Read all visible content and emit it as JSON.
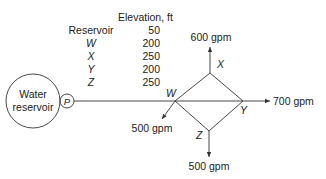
{
  "table": {
    "header": "Elevation, ft",
    "label_header": "Reservoir",
    "rows": [
      {
        "node": "Reservoir",
        "elevation": "50"
      },
      {
        "node": "W",
        "elevation": "200"
      },
      {
        "node": "X",
        "elevation": "250"
      },
      {
        "node": "Y",
        "elevation": "200"
      },
      {
        "node": "Z",
        "elevation": "250"
      }
    ]
  },
  "reservoir": {
    "label_line1": "Water",
    "label_line2": "reservoir"
  },
  "pump": {
    "label": "P"
  },
  "nodes": {
    "W": "W",
    "X": "X",
    "Y": "Y",
    "Z": "Z"
  },
  "flows": {
    "X": "600 gpm",
    "Y": "700 gpm",
    "W": "500 gpm",
    "Z": "500 gpm"
  },
  "colors": {
    "line": "#333333",
    "text": "#222222",
    "background": "#ffffff"
  }
}
